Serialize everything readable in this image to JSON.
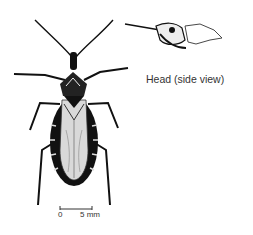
{
  "figure": {
    "head_inset_label": "Head (side view)",
    "scale_bar": {
      "start_label": "0",
      "end_label": "5 mm"
    },
    "colors": {
      "ink": "#111111",
      "background": "#ffffff"
    }
  }
}
